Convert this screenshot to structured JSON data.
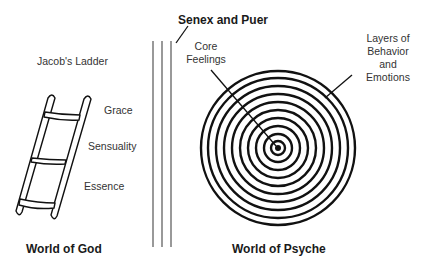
{
  "diagram": {
    "title": "Senex and Puer",
    "left_world": {
      "heading": "World of God",
      "ladder_title": "Jacob's Ladder",
      "rungs": [
        "Grace",
        "Sensuality",
        "Essence"
      ]
    },
    "right_world": {
      "heading": "World of Psyche",
      "core_label_line1": "Core",
      "core_label_line2": "Feelings",
      "layers_label_line1": "Layers of",
      "layers_label_line2": "Behavior",
      "layers_label_line3": "and",
      "layers_label_line4": "Emotions",
      "ring_count": 10
    },
    "divider_lines": 3,
    "colors": {
      "ink": "#111111",
      "text": "#333333",
      "background": "#ffffff"
    }
  }
}
